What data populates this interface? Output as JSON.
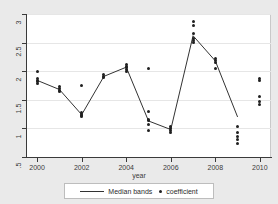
{
  "chart_data": {
    "type": "scatter",
    "title": "",
    "xlabel": "year",
    "ylabel": "",
    "xlim": [
      1999.5,
      2010.5
    ],
    "ylim": [
      0.5,
      3.0
    ],
    "grid": true,
    "x_ticks": [
      2000,
      2002,
      2004,
      2006,
      2008,
      2010
    ],
    "x_tick_labels": [
      "2000",
      "2002",
      "2004",
      "2006",
      "2008",
      "2010"
    ],
    "y_ticks": [
      0.5,
      1.0,
      1.5,
      2.0,
      2.5,
      3.0
    ],
    "y_tick_labels": [
      ".5",
      "1",
      "1.5",
      "2",
      "2.5",
      "3"
    ],
    "legend_position": "bottom",
    "series": [
      {
        "name": "coefficient",
        "type": "scatter",
        "marker": "circle",
        "color": "#202020",
        "points": [
          {
            "x": 2000,
            "y": 1.99
          },
          {
            "x": 2000,
            "y": 1.87
          },
          {
            "x": 2000,
            "y": 1.84
          },
          {
            "x": 2000,
            "y": 1.82
          },
          {
            "x": 2000,
            "y": 1.79
          },
          {
            "x": 2001,
            "y": 1.73
          },
          {
            "x": 2001,
            "y": 1.7
          },
          {
            "x": 2001,
            "y": 1.67
          },
          {
            "x": 2001,
            "y": 1.64
          },
          {
            "x": 2002,
            "y": 1.75
          },
          {
            "x": 2002,
            "y": 1.28
          },
          {
            "x": 2002,
            "y": 1.25
          },
          {
            "x": 2002,
            "y": 1.22
          },
          {
            "x": 2002,
            "y": 1.2
          },
          {
            "x": 2003,
            "y": 1.94
          },
          {
            "x": 2003,
            "y": 1.91
          },
          {
            "x": 2003,
            "y": 1.89
          },
          {
            "x": 2004,
            "y": 2.12
          },
          {
            "x": 2004,
            "y": 2.09
          },
          {
            "x": 2004,
            "y": 2.06
          },
          {
            "x": 2004,
            "y": 2.03
          },
          {
            "x": 2004,
            "y": 2.0
          },
          {
            "x": 2005,
            "y": 2.05
          },
          {
            "x": 2005,
            "y": 1.29
          },
          {
            "x": 2005,
            "y": 1.16
          },
          {
            "x": 2005,
            "y": 1.13
          },
          {
            "x": 2005,
            "y": 1.06
          },
          {
            "x": 2005,
            "y": 0.97
          },
          {
            "x": 2006,
            "y": 1.03
          },
          {
            "x": 2006,
            "y": 1.0
          },
          {
            "x": 2006,
            "y": 0.97
          },
          {
            "x": 2006,
            "y": 0.93
          },
          {
            "x": 2007,
            "y": 2.87
          },
          {
            "x": 2007,
            "y": 2.8
          },
          {
            "x": 2007,
            "y": 2.66
          },
          {
            "x": 2007,
            "y": 2.58
          },
          {
            "x": 2007,
            "y": 2.54
          },
          {
            "x": 2007,
            "y": 2.5
          },
          {
            "x": 2008,
            "y": 2.22
          },
          {
            "x": 2008,
            "y": 2.19
          },
          {
            "x": 2008,
            "y": 2.16
          },
          {
            "x": 2008,
            "y": 2.05
          },
          {
            "x": 2009,
            "y": 1.03
          },
          {
            "x": 2009,
            "y": 0.93
          },
          {
            "x": 2009,
            "y": 0.86
          },
          {
            "x": 2009,
            "y": 0.8
          },
          {
            "x": 2009,
            "y": 0.73
          },
          {
            "x": 2010,
            "y": 1.88
          },
          {
            "x": 2010,
            "y": 1.83
          },
          {
            "x": 2010,
            "y": 1.55
          },
          {
            "x": 2010,
            "y": 1.47
          },
          {
            "x": 2010,
            "y": 1.42
          }
        ]
      },
      {
        "name": "Median bands",
        "type": "line",
        "color": "#333333",
        "x": [
          2000,
          2001,
          2002,
          2003,
          2004,
          2005,
          2006,
          2007,
          2008,
          2009
        ],
        "values": [
          1.84,
          1.68,
          1.24,
          1.91,
          2.07,
          1.13,
          0.98,
          2.62,
          2.18,
          1.2
        ]
      }
    ]
  },
  "legend": {
    "median_label": "Median bands",
    "coefficient_label": "coefficient"
  },
  "axis": {
    "x_title": "year"
  }
}
